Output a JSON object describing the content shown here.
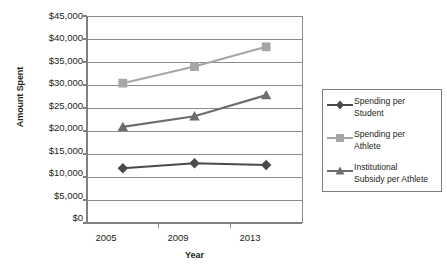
{
  "chart_data": {
    "type": "line",
    "title": "",
    "xlabel": "Year",
    "ylabel": "Amount Spent",
    "categories": [
      "2005",
      "2009",
      "2013"
    ],
    "ylim": [
      0,
      45000
    ],
    "ytick_step": 5000,
    "ytick_labels": [
      "$45,000",
      "$40,000",
      "$35,000",
      "$30,000",
      "$25,000",
      "$20,000",
      "$15,000",
      "$10,000",
      "$5,000",
      "$0"
    ],
    "ytick_values": [
      45000,
      40000,
      35000,
      30000,
      25000,
      20000,
      15000,
      10000,
      5000,
      0
    ],
    "grid": true,
    "legend_position": "right",
    "series": [
      {
        "name": "Spending per Student",
        "marker": "diamond",
        "color": "#4a4a4a",
        "values": [
          11900,
          13000,
          12600
        ]
      },
      {
        "name": "Spending per Athlete",
        "marker": "square",
        "color": "#a6a6a6",
        "values": [
          30400,
          34000,
          38300
        ]
      },
      {
        "name": "Institutional Subsidy per Athlete",
        "marker": "triangle",
        "color": "#6d6d6d",
        "values": [
          20900,
          23200,
          27800
        ]
      }
    ]
  },
  "legend": {
    "items": [
      {
        "label_line1": "Spending per",
        "label_line2": "Student"
      },
      {
        "label_line1": "Spending per",
        "label_line2": "Athlete"
      },
      {
        "label_line1": "Institutional",
        "label_line2": "Subsidy per Athlete"
      }
    ]
  },
  "colors": {
    "axis": "#808080",
    "grid": "#8c8c8c",
    "text": "#231f20",
    "series_student": "#4a4a4a",
    "series_athlete": "#a6a6a6",
    "series_subsidy": "#6d6d6d"
  }
}
